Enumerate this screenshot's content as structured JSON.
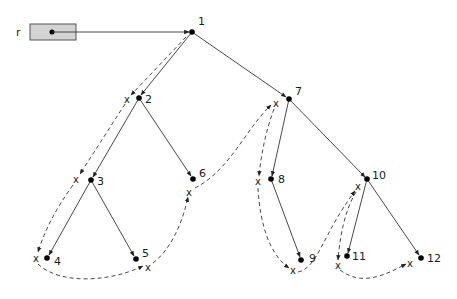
{
  "diagram": {
    "type": "binary-tree-traversal",
    "root_pointer": {
      "label": "r",
      "box": {
        "x": 30,
        "y": 24,
        "w": 46,
        "h": 16
      },
      "fill": "#d3d3d3"
    },
    "nodes": [
      {
        "id": "1",
        "label": "1",
        "x": 192,
        "y": 32,
        "lx": 198,
        "ly": 25
      },
      {
        "id": "2",
        "label": "2",
        "x": 139,
        "y": 98,
        "lx": 145,
        "ly": 103
      },
      {
        "id": "3",
        "label": "3",
        "x": 91,
        "y": 180,
        "lx": 97,
        "ly": 185
      },
      {
        "id": "4",
        "label": "4",
        "x": 47,
        "y": 258,
        "lx": 54,
        "ly": 265
      },
      {
        "id": "5",
        "label": "5",
        "x": 136,
        "y": 259,
        "lx": 142,
        "ly": 257
      },
      {
        "id": "6",
        "label": "6",
        "x": 193,
        "y": 179,
        "lx": 199,
        "ly": 177
      },
      {
        "id": "7",
        "label": "7",
        "x": 289,
        "y": 99,
        "lx": 295,
        "ly": 95
      },
      {
        "id": "8",
        "label": "8",
        "x": 271,
        "y": 179,
        "lx": 278,
        "ly": 183
      },
      {
        "id": "9",
        "label": "9",
        "x": 301,
        "y": 260,
        "lx": 309,
        "ly": 262
      },
      {
        "id": "10",
        "label": "10",
        "x": 367,
        "y": 179,
        "lx": 372,
        "ly": 179
      },
      {
        "id": "11",
        "label": "11",
        "x": 347,
        "y": 256,
        "lx": 352,
        "ly": 260
      },
      {
        "id": "12",
        "label": "12",
        "x": 421,
        "y": 258,
        "lx": 427,
        "ly": 262
      }
    ],
    "edges": [
      [
        "r",
        "1"
      ],
      [
        "1",
        "2"
      ],
      [
        "1",
        "7"
      ],
      [
        "2",
        "3"
      ],
      [
        "2",
        "6"
      ],
      [
        "3",
        "4"
      ],
      [
        "3",
        "5"
      ],
      [
        "7",
        "8"
      ],
      [
        "7",
        "10"
      ],
      [
        "8",
        "9"
      ],
      [
        "10",
        "11"
      ],
      [
        "10",
        "12"
      ]
    ],
    "x_markers": [
      {
        "near": "2",
        "label": "x",
        "x": 127,
        "y": 100
      },
      {
        "near": "3",
        "label": "x",
        "x": 76,
        "y": 180
      },
      {
        "near": "4",
        "label": "x",
        "x": 36,
        "y": 259
      },
      {
        "near": "5",
        "label": "x",
        "x": 148,
        "y": 268
      },
      {
        "near": "6",
        "label": "x",
        "x": 189,
        "y": 193
      },
      {
        "near": "7",
        "label": "x",
        "x": 276,
        "y": 104
      },
      {
        "near": "8",
        "label": "x",
        "x": 258,
        "y": 182
      },
      {
        "near": "9",
        "label": "x",
        "x": 293,
        "y": 271
      },
      {
        "near": "10",
        "label": "x",
        "x": 358,
        "y": 187
      },
      {
        "near": "11",
        "label": "x",
        "x": 338,
        "y": 266
      },
      {
        "near": "12",
        "label": "x",
        "x": 410,
        "y": 264
      }
    ],
    "colors": {
      "line": "#333333",
      "node": "#000000",
      "box_fill": "#d3d3d3",
      "box_stroke": "#555555"
    }
  }
}
